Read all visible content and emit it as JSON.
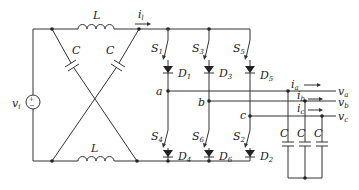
{
  "diagram": {
    "type": "circuit",
    "source": {
      "label": "v",
      "sub": "i",
      "plus": "+",
      "minus": "−"
    },
    "impedance_network": {
      "inductor_top": {
        "label": "L"
      },
      "inductor_bottom": {
        "label": "L"
      },
      "cap_left": {
        "label": "C"
      },
      "cap_right": {
        "label": "C"
      },
      "current": {
        "label": "i",
        "sub": "l"
      }
    },
    "switches": [
      {
        "label": "S",
        "sub": "1"
      },
      {
        "label": "S",
        "sub": "3"
      },
      {
        "label": "S",
        "sub": "5"
      },
      {
        "label": "S",
        "sub": "4"
      },
      {
        "label": "S",
        "sub": "6"
      },
      {
        "label": "S",
        "sub": "2"
      }
    ],
    "diodes": [
      {
        "label": "D",
        "sub": "1"
      },
      {
        "label": "D",
        "sub": "3"
      },
      {
        "label": "D",
        "sub": "5"
      },
      {
        "label": "D",
        "sub": "4"
      },
      {
        "label": "D",
        "sub": "6"
      },
      {
        "label": "D",
        "sub": "2"
      }
    ],
    "nodes": {
      "a": "a",
      "b": "b",
      "c": "c"
    },
    "outputs": [
      {
        "current": "i",
        "current_sub": "a",
        "voltage": "v",
        "voltage_sub": "a"
      },
      {
        "current": "i",
        "current_sub": "b",
        "voltage": "v",
        "voltage_sub": "b"
      },
      {
        "current": "i",
        "current_sub": "c",
        "voltage": "v",
        "voltage_sub": "c"
      }
    ],
    "filter_caps": [
      {
        "label": "C"
      },
      {
        "label": "C"
      },
      {
        "label": "C"
      }
    ]
  }
}
